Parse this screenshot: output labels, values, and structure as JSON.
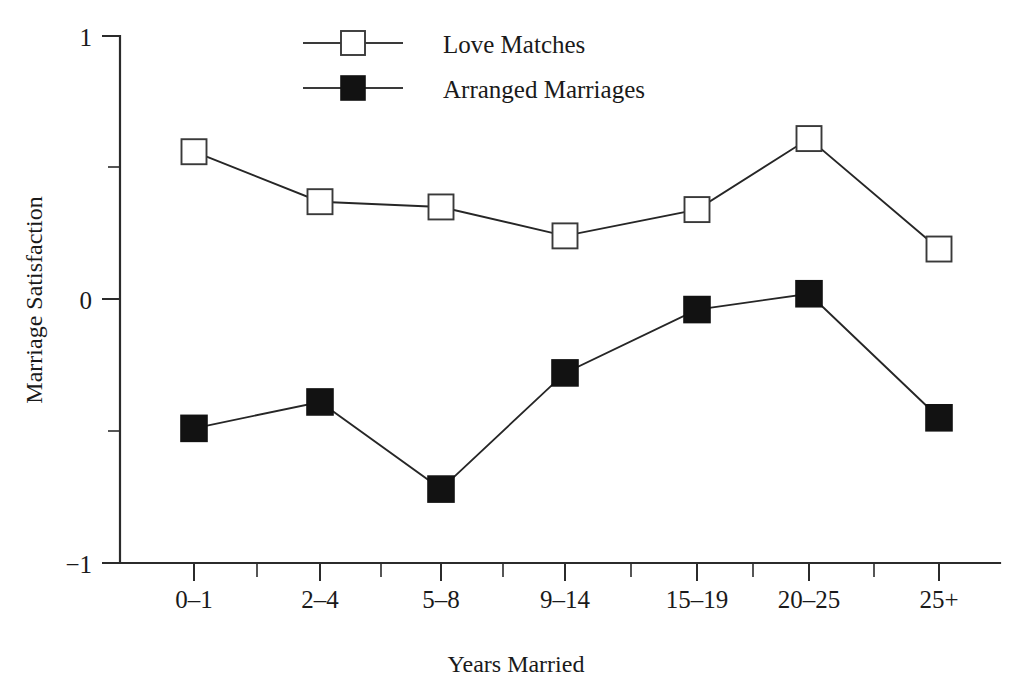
{
  "chart_data": {
    "type": "line",
    "title": "",
    "xlabel": "Years Married",
    "ylabel": "Marriage Satisfaction",
    "categories": [
      "0–1",
      "2–4",
      "5–8",
      "9–14",
      "15–19",
      "20–25",
      "25+"
    ],
    "ylim": [
      -1,
      1
    ],
    "yticks": [
      1,
      0,
      -1
    ],
    "ytick_labels": [
      "1",
      "0",
      "−1"
    ],
    "yminor_ticks": [
      0.5,
      -0.5
    ],
    "grid": false,
    "legend_position": "top-center",
    "series": [
      {
        "name": "Love Matches",
        "marker": "open-square",
        "color": "#3a3a3a",
        "values": [
          0.56,
          0.37,
          0.35,
          0.24,
          0.34,
          0.61,
          0.19
        ]
      },
      {
        "name": "Arranged Marriages",
        "marker": "filled-square",
        "color": "#121212",
        "values": [
          -0.49,
          -0.39,
          -0.72,
          -0.28,
          -0.04,
          0.02,
          -0.45
        ]
      }
    ]
  },
  "legend": {
    "entries": [
      {
        "label": "Love Matches"
      },
      {
        "label": "Arranged Marriages"
      }
    ]
  },
  "axes": {
    "y_title": "Marriage Satisfaction",
    "x_title": "Years Married"
  }
}
